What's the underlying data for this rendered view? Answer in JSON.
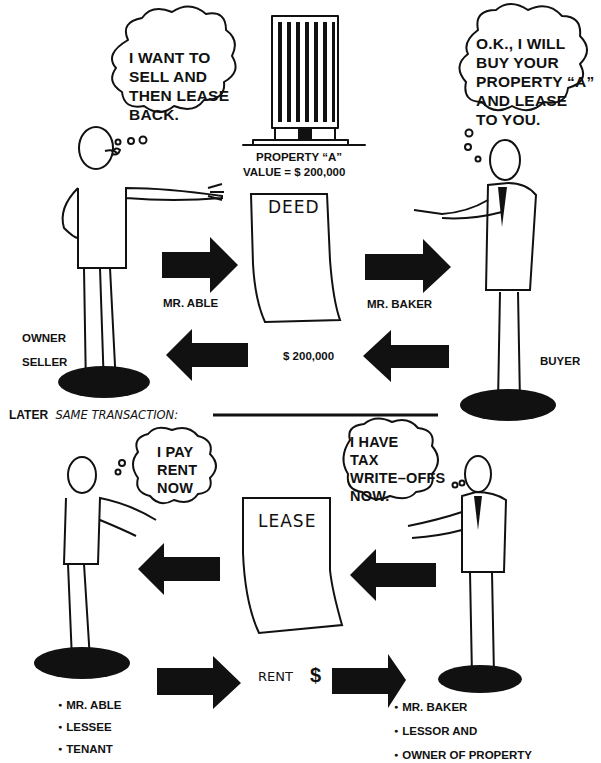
{
  "top": {
    "seller_thought": [
      "I WANT TO",
      "SELL AND",
      "THEN LEASE",
      "BACK."
    ],
    "buyer_thought": [
      "O.K., I WILL",
      "BUY YOUR",
      "PROPERTY “A”",
      "AND LEASE",
      "TO YOU."
    ],
    "property_label": "PROPERTY “A”",
    "property_value": "VALUE = $ 200,000",
    "deed_label": "DEED",
    "left_arrow_label": "MR. ABLE",
    "right_arrow_label": "MR. BAKER",
    "payment_label": "$ 200,000",
    "seller_roles": [
      "OWNER",
      "SELLER"
    ],
    "buyer_role": "BUYER"
  },
  "divider": {
    "later": "LATER",
    "same_transaction": "SAME TRANSACTION:"
  },
  "bottom": {
    "tenant_thought": [
      "I PAY",
      "RENT",
      "NOW"
    ],
    "lessor_thought": [
      "I HAVE",
      "TAX",
      "WRITE–OFFS",
      "NOW."
    ],
    "lease_label": "LEASE",
    "rent_label": "RENT",
    "dollar_sign": "$",
    "tenant_roles": [
      "MR. ABLE",
      "LESSEE",
      "TENANT"
    ],
    "lessor_roles": [
      "MR. BAKER",
      "LESSOR AND",
      "OWNER OF PROPERTY"
    ]
  },
  "colors": {
    "ink": "#111111",
    "paper": "#ffffff"
  }
}
